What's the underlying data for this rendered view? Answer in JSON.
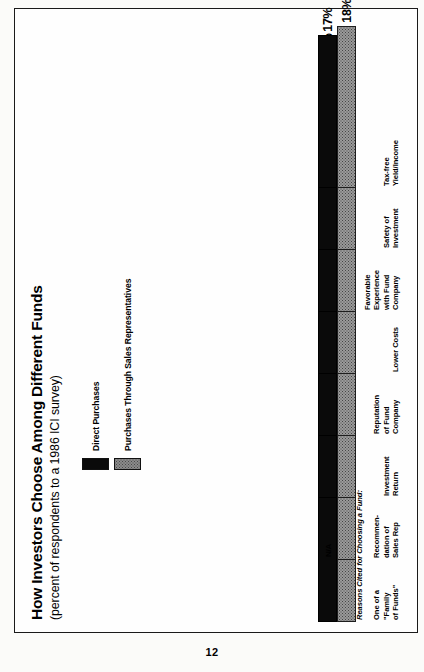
{
  "page": {
    "number": "12"
  },
  "chart": {
    "title": "How Investors Choose Among Different Funds",
    "subtitle": "(percent of respondents to a 1986 ICI survey)",
    "axis_caption": "Reasons Cited for Choosing a Fund:",
    "na_marker": "N/A",
    "legend": [
      {
        "label": "Direct Purchases",
        "swatch": "black-swatch-icon",
        "color": "#0a0a0a"
      },
      {
        "label": "Purchases Through Sales Representatives",
        "swatch": "gray-dotted-swatch-icon",
        "color": "#9a9a9a"
      }
    ]
  },
  "chart_data": {
    "type": "bar",
    "orientation": "horizontal",
    "title": "How Investors Choose Among Different Funds",
    "subtitle": "(percent of respondents to a 1986 ICI survey)",
    "xlabel": "Reasons Cited for Choosing a Fund:",
    "ylabel": "percent of respondents",
    "ylim": [
      0,
      55
    ],
    "grid": false,
    "legend_position": "top-left",
    "categories": [
      "One of a \"Family of Funds\"",
      "Recommendation of Sales Rep",
      "Investment Return",
      "Reputation of Fund Company",
      "Lower Costs",
      "Favorable Experience with Fund Company",
      "Safety of Investment",
      "Tax-free Yield/Income"
    ],
    "category_lines": [
      "One of a\n\"Family\nof Funds\"",
      "Recommen-\ndation of\nSales Rep",
      "Investment\nReturn",
      "Reputation\nof Fund\nCompany",
      "Lower Costs",
      "Favorable\nExperience\nwith Fund\nCompany",
      "Safety of\nInvestment",
      "Tax-free\nYield/Income"
    ],
    "series": [
      {
        "name": "Direct Purchases",
        "color": "#0a0a0a",
        "values": [
          51,
          null,
          46,
          33,
          28,
          27,
          21,
          17
        ],
        "labels": [
          "51%",
          "N/A",
          "46%",
          "33%",
          "28%",
          "27%",
          "21%",
          "17%"
        ]
      },
      {
        "name": "Purchases Through Sales Representatives",
        "color": "#9a9a9a",
        "values": [
          23,
          44,
          32,
          16,
          8,
          12,
          21,
          18
        ],
        "labels": [
          "23%",
          "44%",
          "32%",
          "16%",
          "8%",
          "12%",
          "21%",
          "18%"
        ]
      }
    ]
  }
}
